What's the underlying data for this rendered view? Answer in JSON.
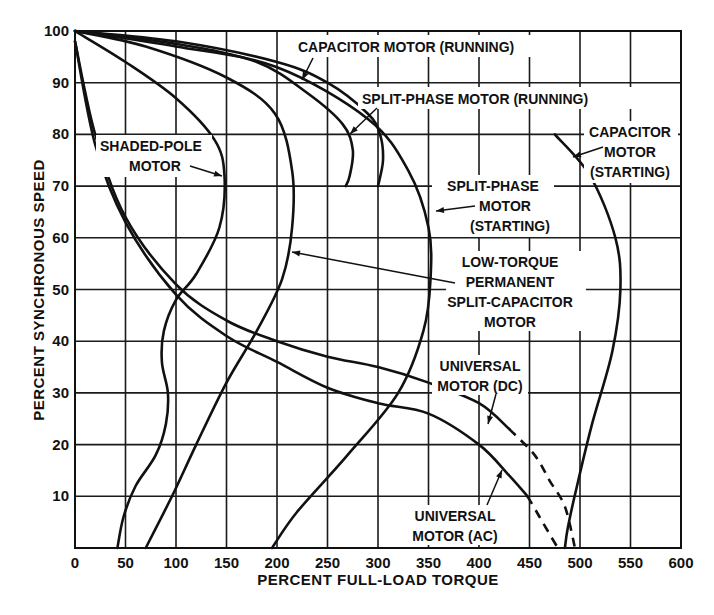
{
  "chart_data": {
    "type": "line",
    "title": "",
    "xlabel": "PERCENT FULL-LOAD TORQUE",
    "ylabel": "PERCENT SYNCHRONOUS SPEED",
    "xlim": [
      0,
      600
    ],
    "ylim": [
      0,
      100
    ],
    "x_ticks": [
      0,
      50,
      100,
      150,
      200,
      250,
      300,
      350,
      400,
      450,
      500,
      550,
      600
    ],
    "y_ticks": [
      0,
      10,
      20,
      30,
      40,
      50,
      60,
      70,
      80,
      90,
      100
    ],
    "grid": true,
    "legend": "none (curves labeled by annotations with leader lines)",
    "series": [
      {
        "name": "CAPACITOR MOTOR (RUNNING)",
        "style": "solid",
        "points": [
          [
            0,
            100
          ],
          [
            100,
            98
          ],
          [
            200,
            94
          ],
          [
            250,
            90
          ],
          [
            290,
            84
          ],
          [
            302,
            80
          ],
          [
            305,
            75
          ],
          [
            300,
            70
          ]
        ]
      },
      {
        "name": "SPLIT-PHASE MOTOR (RUNNING)",
        "style": "solid",
        "points": [
          [
            0,
            100
          ],
          [
            100,
            97.5
          ],
          [
            180,
            94
          ],
          [
            230,
            88
          ],
          [
            265,
            82
          ],
          [
            275,
            77
          ],
          [
            272,
            72
          ],
          [
            268,
            70
          ]
        ]
      },
      {
        "name": "SPLIT-PHASE MOTOR (STARTING)",
        "style": "solid",
        "points": [
          [
            0,
            100
          ],
          [
            100,
            97
          ],
          [
            200,
            93
          ],
          [
            290,
            83
          ],
          [
            330,
            73
          ],
          [
            350,
            62
          ],
          [
            352,
            52
          ],
          [
            345,
            42
          ],
          [
            320,
            30
          ],
          [
            270,
            18
          ],
          [
            220,
            7
          ],
          [
            195,
            0
          ]
        ]
      },
      {
        "name": "CAPACITOR MOTOR (STARTING)",
        "style": "solid",
        "points": [
          [
            475,
            80
          ],
          [
            510,
            72
          ],
          [
            535,
            60
          ],
          [
            540,
            50
          ],
          [
            532,
            38
          ],
          [
            512,
            24
          ],
          [
            497,
            12
          ],
          [
            488,
            4
          ],
          [
            485,
            0
          ]
        ]
      },
      {
        "name": "SHADED-POLE MOTOR",
        "style": "solid",
        "points": [
          [
            0,
            100
          ],
          [
            50,
            94
          ],
          [
            100,
            87
          ],
          [
            138,
            79
          ],
          [
            148,
            72
          ],
          [
            143,
            62
          ],
          [
            120,
            53
          ],
          [
            100,
            48
          ],
          [
            88,
            42
          ],
          [
            86,
            36
          ],
          [
            92,
            30
          ],
          [
            90,
            24
          ],
          [
            80,
            18
          ],
          [
            60,
            12
          ],
          [
            48,
            6
          ],
          [
            42,
            0
          ]
        ]
      },
      {
        "name": "LOW-TORQUE PERMANENT SPLIT-CAPACITOR MOTOR",
        "style": "solid",
        "points": [
          [
            0,
            100
          ],
          [
            70,
            97
          ],
          [
            150,
            91
          ],
          [
            198,
            84
          ],
          [
            215,
            73
          ],
          [
            215,
            62
          ],
          [
            205,
            52
          ],
          [
            180,
            42
          ],
          [
            150,
            32
          ],
          [
            120,
            20
          ],
          [
            96,
            10
          ],
          [
            70,
            0
          ]
        ]
      },
      {
        "name": "UNIVERSAL MOTOR (DC)",
        "style": "solid-then-dashed",
        "points": [
          [
            0,
            98
          ],
          [
            20,
            80
          ],
          [
            50,
            64
          ],
          [
            100,
            51
          ],
          [
            150,
            44
          ],
          [
            200,
            40
          ],
          [
            250,
            37
          ],
          [
            300,
            35
          ],
          [
            350,
            32
          ],
          [
            400,
            28
          ],
          [
            430,
            23
          ]
        ],
        "dashed_points": [
          [
            430,
            23
          ],
          [
            455,
            18
          ],
          [
            470,
            13
          ],
          [
            485,
            8
          ],
          [
            495,
            0
          ]
        ]
      },
      {
        "name": "UNIVERSAL MOTOR (AC)",
        "style": "solid-then-dashed",
        "points": [
          [
            0,
            98
          ],
          [
            20,
            78
          ],
          [
            50,
            63
          ],
          [
            100,
            49
          ],
          [
            150,
            41
          ],
          [
            200,
            36
          ],
          [
            250,
            31
          ],
          [
            300,
            28
          ],
          [
            350,
            26
          ],
          [
            400,
            20
          ],
          [
            430,
            14
          ],
          [
            448,
            10
          ]
        ],
        "dashed_points": [
          [
            448,
            10
          ],
          [
            460,
            6
          ],
          [
            472,
            2
          ],
          [
            478,
            0
          ]
        ]
      }
    ],
    "annotations": [
      {
        "lines": [
          "CAPACITOR MOTOR (RUNNING)"
        ],
        "points_to": [
          240,
          91
        ]
      },
      {
        "lines": [
          "SPLIT-PHASE MOTOR (RUNNING)"
        ],
        "points_to": [
          265,
          80
        ]
      },
      {
        "lines": [
          "SHADED-POLE",
          "MOTOR"
        ],
        "points_to": [
          148,
          72
        ]
      },
      {
        "lines": [
          "CAPACITOR",
          "MOTOR",
          "(STARTING)"
        ],
        "points_to": [
          500,
          75
        ]
      },
      {
        "lines": [
          "SPLIT-PHASE",
          "MOTOR",
          "(STARTING)"
        ],
        "points_to": [
          352,
          65
        ]
      },
      {
        "lines": [
          "LOW-TORQUE",
          "PERMANENT",
          "SPLIT-CAPACITOR",
          "MOTOR"
        ],
        "points_to": [
          220,
          57
        ]
      },
      {
        "lines": [
          "UNIVERSAL",
          "MOTOR (DC)"
        ],
        "points_to": [
          400,
          28
        ]
      },
      {
        "lines": [
          "UNIVERSAL",
          "MOTOR (AC)"
        ],
        "points_to": [
          425,
          15
        ]
      }
    ]
  },
  "labels": {
    "xlabel": "PERCENT FULL-LOAD TORQUE",
    "ylabel": "PERCENT SYNCHRONOUS SPEED",
    "annot_cap_run": "CAPACITOR MOTOR (RUNNING)",
    "annot_split_run": "SPLIT-PHASE MOTOR (RUNNING)",
    "annot_shaded_1": "SHADED-POLE",
    "annot_shaded_2": "MOTOR",
    "annot_cap_start_1": "CAPACITOR",
    "annot_cap_start_2": "MOTOR",
    "annot_cap_start_3": "(STARTING)",
    "annot_split_start_1": "SPLIT-PHASE",
    "annot_split_start_2": "MOTOR",
    "annot_split_start_3": "(STARTING)",
    "annot_psc_1": "LOW-TORQUE",
    "annot_psc_2": "PERMANENT",
    "annot_psc_3": "SPLIT-CAPACITOR",
    "annot_psc_4": "MOTOR",
    "annot_udc_1": "UNIVERSAL",
    "annot_udc_2": "MOTOR (DC)",
    "annot_uac_1": "UNIVERSAL",
    "annot_uac_2": "MOTOR (AC)"
  }
}
